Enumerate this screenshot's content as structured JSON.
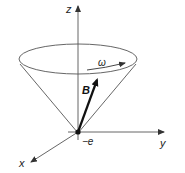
{
  "diagram": {
    "type": "precessing magnetic moment cone",
    "labels": {
      "z_axis": "z",
      "y_axis": "y",
      "x_axis": "x",
      "vector": "B",
      "angular_velocity": "ω",
      "charge": "−e"
    },
    "colors": {
      "line": "#555555",
      "vector": "#111111",
      "background": "#ffffff"
    }
  }
}
